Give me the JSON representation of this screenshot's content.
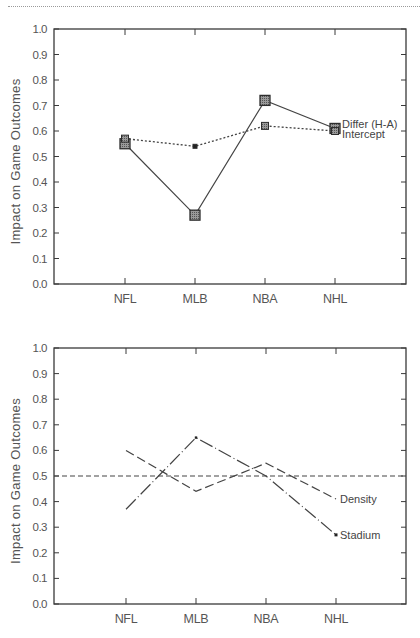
{
  "chart_data": [
    {
      "type": "line",
      "title": "",
      "xlabel": "",
      "ylabel": "Impact on Game Outcomes",
      "ylim": [
        0.0,
        1.0
      ],
      "yticks": [
        "0.0",
        "0.1",
        "0.2",
        "0.3",
        "0.4",
        "0.5",
        "0.6",
        "0.7",
        "0.8",
        "0.9",
        "1.0"
      ],
      "categories": [
        "NFL",
        "MLB",
        "NBA",
        "NHL"
      ],
      "grid": false,
      "legend_position": "inline-right",
      "series": [
        {
          "name": "Differ (H-A)",
          "style": "solid",
          "marker": "large-hatched-square",
          "values": [
            0.55,
            0.27,
            0.72,
            0.61
          ]
        },
        {
          "name": "Intercept",
          "style": "dotted",
          "marker": "small-square",
          "values": [
            0.57,
            0.54,
            0.62,
            0.6
          ]
        }
      ]
    },
    {
      "type": "line",
      "title": "",
      "xlabel": "",
      "ylabel": "Impact on Game Outcomes",
      "ylim": [
        0.0,
        1.0
      ],
      "yticks": [
        "0.0",
        "0.1",
        "0.2",
        "0.3",
        "0.4",
        "0.5",
        "0.6",
        "0.7",
        "0.8",
        "0.9",
        "1.0"
      ],
      "categories": [
        "NFL",
        "MLB",
        "NBA",
        "NHL"
      ],
      "grid": false,
      "legend_position": "inline-right",
      "reference_line": {
        "y": 0.5,
        "style": "short-dash"
      },
      "series": [
        {
          "name": "Density",
          "style": "long-dash",
          "values": [
            0.6,
            0.44,
            0.55,
            0.41
          ]
        },
        {
          "name": "Stadium",
          "style": "long-dash-dot",
          "values": [
            0.37,
            0.65,
            0.5,
            0.27
          ]
        }
      ]
    }
  ],
  "colors": {
    "axis": "#3a3a3a",
    "line": "#444444",
    "text": "#555555",
    "marker_fill": "#8c8c8c"
  }
}
